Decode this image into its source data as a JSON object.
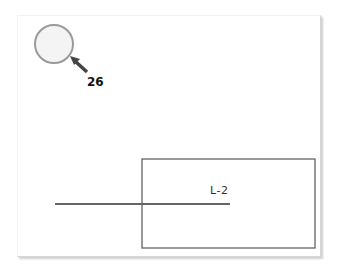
{
  "diagram": {
    "callout": {
      "number": "26",
      "shape": "circle",
      "pointer": "arrow-icon"
    },
    "line": {
      "label": "L-2"
    },
    "region": {
      "shape": "rectangle"
    },
    "colors": {
      "stroke": "#555555",
      "circle_stroke": "#999999",
      "circle_fill": "#f4f4f4",
      "background": "#ffffff"
    }
  }
}
